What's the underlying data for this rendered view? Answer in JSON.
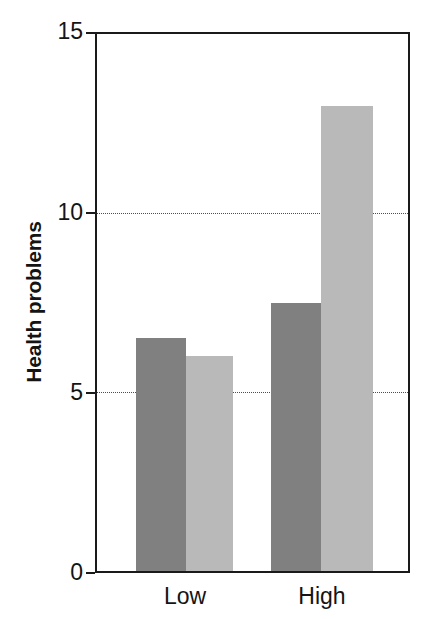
{
  "chart_data": {
    "type": "bar",
    "title": "",
    "subtitle": "",
    "xlabel": "",
    "ylabel": "Health problems",
    "categories": [
      "Low",
      "High"
    ],
    "series": [
      {
        "name": "series-1",
        "color": "#808080",
        "values": [
          6.5,
          7.5
        ]
      },
      {
        "name": "series-2",
        "color": "#b9b9b9",
        "values": [
          6.0,
          13.0
        ]
      }
    ],
    "ylim": [
      0,
      15
    ],
    "yticks": [
      0,
      5,
      10,
      15
    ],
    "ytick_labels": [
      "0",
      "5",
      "10",
      "15"
    ],
    "gridlines_at": [
      5,
      10
    ],
    "grid": true,
    "grid_style": "dotted",
    "legend": "none",
    "frame": true,
    "frame_color": "#1a1a1a",
    "background": "#ffffff"
  },
  "axis": {
    "y_title": "Health problems",
    "tick_0": "0",
    "tick_5": "5",
    "tick_10": "10",
    "tick_15": "15",
    "cat_low": "Low",
    "cat_high": "High"
  }
}
